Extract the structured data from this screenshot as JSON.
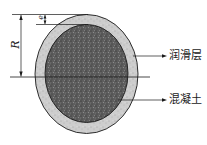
{
  "figure": {
    "labels": {
      "lubrication_layer": "润滑层",
      "concrete": "混凝土",
      "radius": "R",
      "thickness": "e"
    },
    "colors": {
      "outline": "#1a1a1a",
      "lubrication_layer_fill": "#c9c9c9",
      "concrete_fill": "#5a5a5a",
      "background": "#ffffff"
    }
  }
}
